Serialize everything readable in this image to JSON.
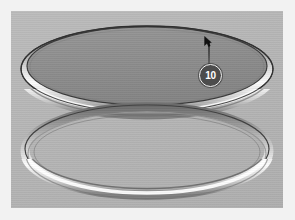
{
  "viewport": {
    "background_color": "#b4b4b4",
    "frame_color": "#f2f2f2",
    "title": "3D Model Viewport"
  },
  "model": {
    "name": "Two concentric torus rings with capped top disc",
    "top_disc": {
      "label": "Top capped ring",
      "fill_color": "#8e8e8e",
      "outline_color": "#3a3a3a"
    },
    "top_ring": {
      "label": "Upper torus ring",
      "highlight_color": "#fbfbfb",
      "shadow_color": "#5a5a5a"
    },
    "bottom_ring": {
      "label": "Lower torus ring",
      "highlight_color": "#fbfbfb",
      "shadow_color": "#4e4e4e"
    }
  },
  "annotation": {
    "balloon_label": "10",
    "balloon_fill": "#4c4c4c",
    "balloon_ring": "#f4f4f4",
    "balloon_text_color": "#ffffff",
    "leader_color": "#3b3b3b",
    "cursor_name": "arrow-cursor"
  }
}
